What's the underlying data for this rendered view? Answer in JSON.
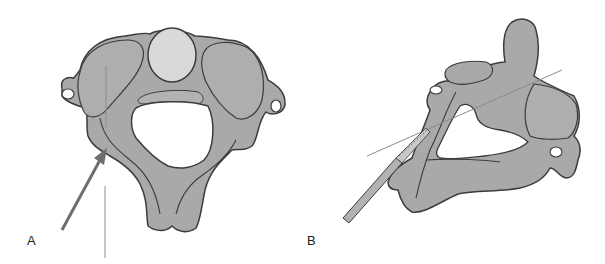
{
  "figure": {
    "panels": [
      {
        "label": "A",
        "view": "superior view of cervical vertebra with arrow and reference line"
      },
      {
        "label": "B",
        "view": "oblique lateral view of cervical vertebra with drill instrument and trajectory line"
      }
    ],
    "colors": {
      "bone": "#a9a9a9",
      "vertebral_body": "#d9d9d9",
      "outline": "#3c3c3c",
      "arrow": "#6e6e6e",
      "line": "#8a8a8a",
      "background": "#ffffff"
    }
  }
}
